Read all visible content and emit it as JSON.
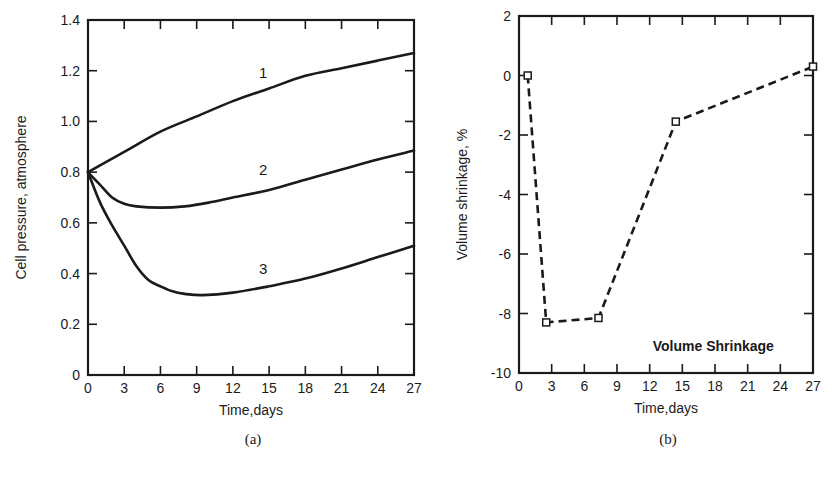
{
  "chart_data": [
    {
      "id": "a",
      "type": "line",
      "title": "",
      "caption": "(a)",
      "xlabel": "Time,days",
      "ylabel": "Cell pressure, atmosphere",
      "xlim": [
        0,
        27
      ],
      "ylim": [
        0,
        1.4
      ],
      "xticks": [
        0,
        3,
        6,
        9,
        12,
        15,
        18,
        21,
        24,
        27
      ],
      "yticks": [
        0,
        0.2,
        0.4,
        0.6,
        0.8,
        1.0,
        1.2,
        1.4
      ],
      "ytick_labels": [
        "0",
        "0.2",
        "0.4",
        "0.6",
        "0.8",
        "1.0",
        "1.2",
        "1.4"
      ],
      "grid": false,
      "series": [
        {
          "name": "1",
          "label_at": [
            14.5,
            1.17
          ],
          "x": [
            0,
            3,
            6,
            9,
            12,
            15,
            18,
            21,
            24,
            27
          ],
          "values": [
            0.8,
            0.88,
            0.96,
            1.02,
            1.08,
            1.13,
            1.18,
            1.21,
            1.24,
            1.27
          ]
        },
        {
          "name": "2",
          "label_at": [
            14.5,
            0.79
          ],
          "x": [
            0,
            1,
            2,
            3,
            4,
            6,
            8,
            10,
            12,
            15,
            18,
            21,
            24,
            27
          ],
          "values": [
            0.8,
            0.75,
            0.7,
            0.675,
            0.665,
            0.66,
            0.665,
            0.68,
            0.7,
            0.73,
            0.77,
            0.81,
            0.85,
            0.885
          ]
        },
        {
          "name": "3",
          "label_at": [
            14.5,
            0.4
          ],
          "x": [
            0,
            1,
            2,
            3,
            4,
            5,
            6,
            7,
            8,
            9.5,
            12,
            15,
            18,
            21,
            24,
            27
          ],
          "values": [
            0.8,
            0.68,
            0.59,
            0.51,
            0.43,
            0.375,
            0.35,
            0.33,
            0.32,
            0.315,
            0.325,
            0.35,
            0.38,
            0.42,
            0.465,
            0.51
          ]
        }
      ]
    },
    {
      "id": "b",
      "type": "line",
      "title": "",
      "caption": "(b)",
      "xlabel": "Time,days",
      "ylabel": "Volume shrinkage, %",
      "xlim": [
        0,
        27
      ],
      "ylim": [
        -10,
        2
      ],
      "xticks": [
        0,
        3,
        6,
        9,
        12,
        15,
        18,
        21,
        24,
        27
      ],
      "yticks": [
        -10,
        -8,
        -6,
        -4,
        -2,
        0,
        2
      ],
      "grid": false,
      "legend": {
        "text": "Volume Shrinkage",
        "position": "bottom-right"
      },
      "series": [
        {
          "name": "Volume Shrinkage",
          "style": "dashed",
          "marker": "square-open",
          "x": [
            0.8,
            2.5,
            7.3,
            14.4,
            27
          ],
          "values": [
            0,
            -8.3,
            -8.15,
            -1.55,
            0.3
          ]
        }
      ]
    }
  ]
}
